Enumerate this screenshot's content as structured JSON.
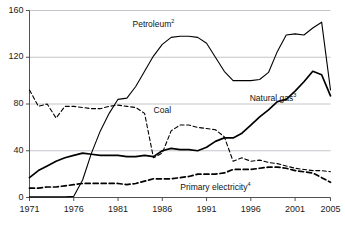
{
  "chart_data": {
    "type": "line",
    "title": "",
    "xlabel": "",
    "ylabel": "",
    "xlim": [
      1971,
      2005
    ],
    "ylim": [
      0,
      160
    ],
    "grid": true,
    "legend_position": "inline-annotations",
    "x": [
      1971,
      1972,
      1973,
      1974,
      1975,
      1976,
      1977,
      1978,
      1979,
      1980,
      1981,
      1982,
      1983,
      1984,
      1985,
      1986,
      1987,
      1988,
      1989,
      1990,
      1991,
      1992,
      1993,
      1994,
      1995,
      1996,
      1997,
      1998,
      1999,
      2000,
      2001,
      2002,
      2003,
      2004,
      2005
    ],
    "x_tick_labels": [
      "1971",
      "1976",
      "1981",
      "1986",
      "1991",
      "1996",
      "2001",
      "2005"
    ],
    "x_ticks": [
      1971,
      1976,
      1981,
      1986,
      1991,
      1996,
      2001,
      2005
    ],
    "y_ticks": [
      0,
      40,
      80,
      120,
      160
    ],
    "y_tick_labels": [
      "0",
      "40",
      "80",
      "120",
      "160"
    ],
    "series": [
      {
        "name": "Petroleum",
        "superscript": "2",
        "style": "solid",
        "color": "#000000",
        "width": 1.1,
        "label_x": 1985.0,
        "label_y": 148,
        "values": [
          0.5,
          0.5,
          0.5,
          0.5,
          0.5,
          1,
          15,
          38,
          57,
          72,
          84,
          85,
          95,
          108,
          121,
          131,
          137,
          138,
          138,
          137,
          132,
          120,
          108,
          100,
          100,
          100,
          101,
          107,
          125,
          139,
          140,
          139,
          145,
          150,
          92
        ]
      },
      {
        "name": "Natural gas",
        "superscript": "3",
        "style": "solid",
        "color": "#000000",
        "width": 1.7,
        "label_x": 1998.5,
        "label_y": 84,
        "values": [
          17,
          23,
          27,
          31,
          34,
          36,
          38,
          37,
          36,
          36,
          36,
          35,
          35,
          36,
          35,
          40,
          42,
          41,
          41,
          40,
          43,
          48,
          51,
          51,
          55,
          62,
          69,
          75,
          82,
          84,
          91,
          99,
          108,
          105,
          87
        ]
      },
      {
        "name": "Coal",
        "superscript": "",
        "style": "dashed",
        "color": "#000000",
        "width": 1.1,
        "label_x": 1986.0,
        "label_y": 74,
        "values": [
          92,
          78,
          80,
          68,
          78,
          78,
          77,
          76,
          76,
          78,
          79,
          78,
          77,
          72,
          34,
          38,
          57,
          62,
          62,
          60,
          59,
          58,
          52,
          31,
          34,
          31,
          32,
          30,
          29,
          27,
          25,
          24,
          23,
          23,
          22
        ]
      },
      {
        "name": "Primary electricity",
        "superscript": "4",
        "style": "dashed",
        "color": "#000000",
        "width": 1.7,
        "label_x": 1992.0,
        "label_y": 8,
        "values": [
          8,
          8,
          9,
          9,
          10,
          11,
          12,
          12,
          12,
          12,
          12,
          11,
          12,
          14,
          16,
          16,
          16,
          17,
          18,
          20,
          20,
          20,
          21,
          24,
          24,
          24,
          25,
          26,
          26,
          25,
          23,
          22,
          21,
          17,
          13
        ]
      }
    ]
  },
  "axis": {
    "y_axis_name": "value-axis",
    "x_axis_name": "year-axis"
  }
}
